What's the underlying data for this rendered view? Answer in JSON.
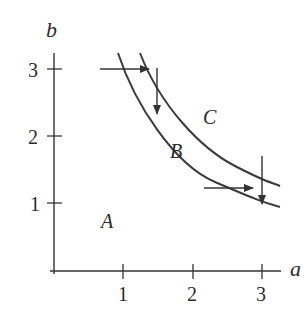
{
  "diagram": {
    "axes": {
      "x_label": "a",
      "y_label": "b",
      "x_ticks": [
        "1",
        "2",
        "3"
      ],
      "y_ticks": [
        "1",
        "2",
        "3"
      ]
    },
    "regions": {
      "A": "A",
      "B": "B",
      "C": "C"
    },
    "curves": [
      {
        "name": "lower-boundary",
        "description": "boundary between regions A and B"
      },
      {
        "name": "upper-boundary",
        "description": "boundary between regions B and C"
      }
    ],
    "arrows": [
      {
        "direction": "right",
        "from": [
          0.67,
          3.0
        ],
        "to": [
          1.4,
          3.0
        ]
      },
      {
        "direction": "down",
        "from": [
          1.5,
          3.0
        ],
        "to": [
          1.5,
          2.35
        ]
      },
      {
        "direction": "right",
        "from": [
          2.15,
          1.25
        ],
        "to": [
          2.85,
          1.25
        ]
      },
      {
        "direction": "down",
        "from": [
          3.0,
          1.7
        ],
        "to": [
          3.0,
          1.0
        ]
      }
    ],
    "colors": {
      "stroke": "#3a3a3a",
      "text": "#2a2a2a"
    }
  }
}
